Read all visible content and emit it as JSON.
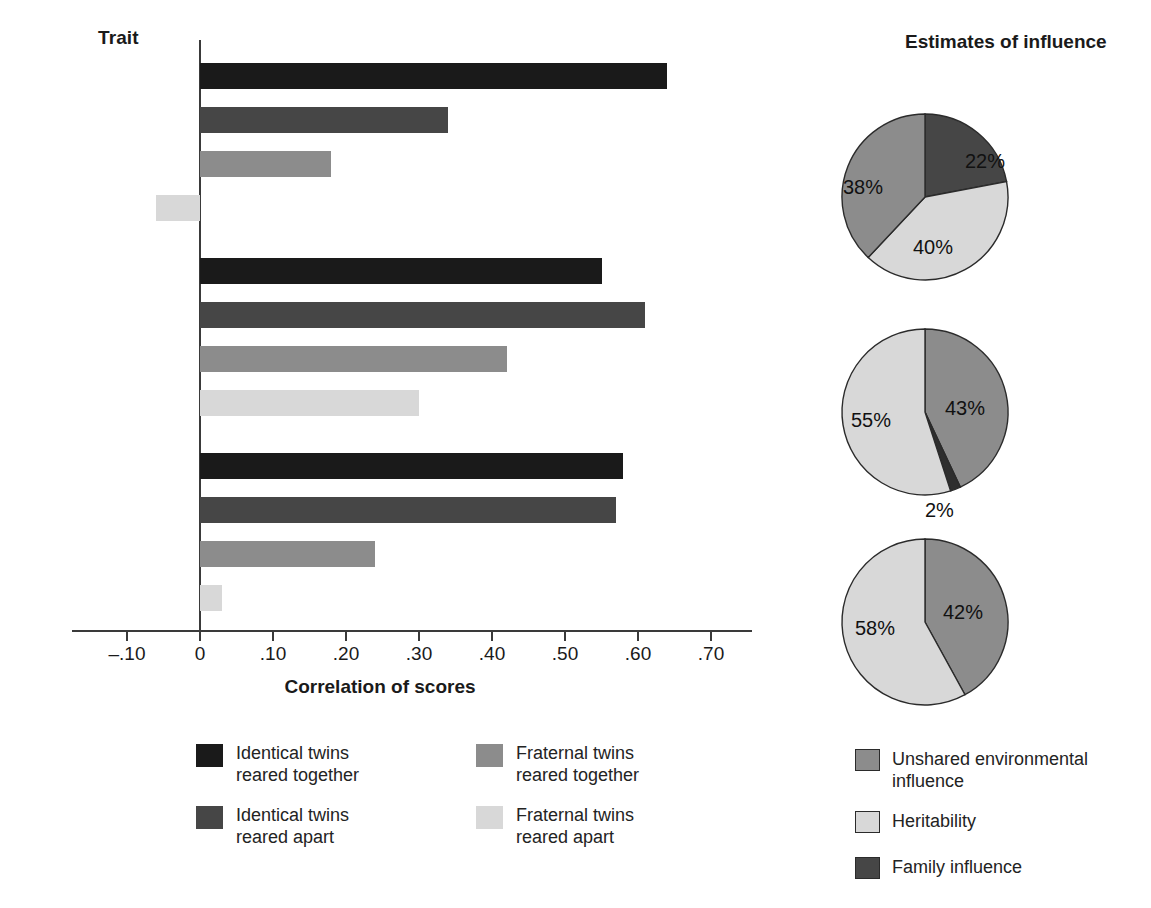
{
  "bar_panel": {
    "trait_header": "Trait",
    "x_axis_title": "Correlation of scores",
    "tick_labels": [
      "–.10",
      "0",
      ".10",
      ".20",
      ".30",
      ".40",
      ".50",
      ".60",
      ".70"
    ],
    "tick_values": [
      -0.1,
      0,
      0.1,
      0.2,
      0.3,
      0.4,
      0.5,
      0.6,
      0.7
    ],
    "trait_labels": [
      {
        "line1": "Positive",
        "line2": "emotionality"
      },
      {
        "line1": "Negative",
        "line2": "emotionality"
      },
      {
        "line1": "Constraint",
        "line2": ""
      }
    ],
    "legend": [
      {
        "label": "Identical twins\nreared together",
        "color": "#1a1a1a"
      },
      {
        "label": "Identical twins\nreared apart",
        "color": "#464646"
      },
      {
        "label": "Fraternal twins\nreared together",
        "color": "#8c8c8c"
      },
      {
        "label": "Fraternal twins\nreared apart",
        "color": "#d8d8d8"
      }
    ]
  },
  "pie_panel": {
    "header": "Estimates of\ninfluence",
    "legend": [
      {
        "label": "Unshared environmental\ninfluence",
        "color": "#8c8c8c"
      },
      {
        "label": "Heritability",
        "color": "#d8d8d8"
      },
      {
        "label": "Family influence",
        "color": "#464646"
      }
    ]
  },
  "chart_data": [
    {
      "type": "bar",
      "orientation": "horizontal",
      "title": "",
      "xlabel": "Correlation of scores",
      "ylabel": "Trait",
      "xlim": [
        -0.1,
        0.7
      ],
      "xticks": [
        -0.1,
        0,
        0.1,
        0.2,
        0.3,
        0.4,
        0.5,
        0.6,
        0.7
      ],
      "xticklabels": [
        "–.10",
        "0",
        ".10",
        ".20",
        ".30",
        ".40",
        ".50",
        ".60",
        ".70"
      ],
      "grid": false,
      "legend_position": "bottom",
      "categories": [
        "Positive emotionality",
        "Negative emotionality",
        "Constraint"
      ],
      "series": [
        {
          "name": "Identical twins reared together",
          "color": "#1a1a1a",
          "values": [
            0.64,
            0.55,
            0.58
          ]
        },
        {
          "name": "Identical twins reared apart",
          "color": "#464646",
          "values": [
            0.34,
            0.61,
            0.57
          ]
        },
        {
          "name": "Fraternal twins reared together",
          "color": "#8c8c8c",
          "values": [
            0.18,
            0.42,
            0.24
          ]
        },
        {
          "name": "Fraternal twins reared apart",
          "color": "#d8d8d8",
          "values": [
            -0.06,
            0.3,
            0.03
          ]
        }
      ]
    },
    {
      "type": "pie",
      "title": "Estimates of influence",
      "panel": "Positive emotionality",
      "labels": [
        "Family influence",
        "Heritability",
        "Unshared environmental influence"
      ],
      "values": [
        22,
        40,
        38
      ],
      "value_labels": [
        "22%",
        "40%",
        "38%"
      ],
      "colors": [
        "#464646",
        "#d8d8d8",
        "#8c8c8c"
      ]
    },
    {
      "type": "pie",
      "title": "Estimates of influence",
      "panel": "Negative emotionality",
      "labels": [
        "Unshared environmental influence",
        "Family influence",
        "Heritability"
      ],
      "values": [
        43,
        2,
        55
      ],
      "value_labels": [
        "43%",
        "2%",
        "55%"
      ],
      "colors": [
        "#8c8c8c",
        "#2e2e2e",
        "#d8d8d8"
      ]
    },
    {
      "type": "pie",
      "title": "Estimates of influence",
      "panel": "Constraint",
      "labels": [
        "Unshared environmental influence",
        "Heritability"
      ],
      "values": [
        42,
        58
      ],
      "value_labels": [
        "42%",
        "58%"
      ],
      "colors": [
        "#8c8c8c",
        "#d8d8d8"
      ]
    }
  ]
}
